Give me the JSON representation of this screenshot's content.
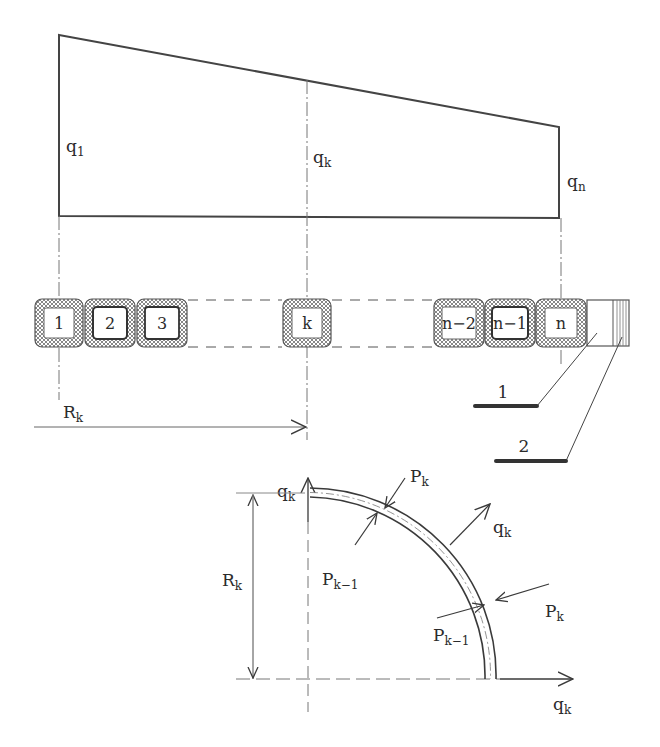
{
  "figure": {
    "type": "engineering-diagram"
  },
  "load_diagram": {
    "labels": {
      "q1": {
        "base": "q",
        "sub": "1"
      },
      "qk": {
        "base": "q",
        "sub": "k"
      },
      "qn": {
        "base": "q",
        "sub": "n"
      }
    }
  },
  "turn_row": {
    "cells": [
      {
        "label": "1",
        "bold_core": false
      },
      {
        "label": "2",
        "bold_core": true
      },
      {
        "label": "3",
        "bold_core": true
      },
      {
        "label": "k",
        "bold_core": false
      },
      {
        "label": "n−2",
        "bold_core": false
      },
      {
        "label": "n−1",
        "bold_core": true
      },
      {
        "label": "n",
        "bold_core": false
      }
    ],
    "callouts": [
      {
        "label": "1"
      },
      {
        "label": "2"
      }
    ]
  },
  "radius": {
    "base": "R",
    "sub": "k"
  },
  "arc_detail": {
    "axis_vertical": {
      "base": "q",
      "sub": "k"
    },
    "axis_horizontal": {
      "base": "q",
      "sub": "k"
    },
    "radius_label": {
      "base": "R",
      "sub": "k"
    },
    "forces": [
      {
        "base": "P",
        "sub": "k",
        "position": "upper-outer"
      },
      {
        "base": "P",
        "sub": "k−1",
        "position": "upper-inner"
      },
      {
        "base": "q",
        "sub": "k",
        "position": "radial-out"
      },
      {
        "base": "P",
        "sub": "k",
        "position": "lower-outer"
      },
      {
        "base": "P",
        "sub": "k−1",
        "position": "lower-inner"
      }
    ]
  },
  "colors": {
    "line": "#3a3a3a",
    "hatch": "#8a8a8a",
    "background": "#ffffff"
  }
}
